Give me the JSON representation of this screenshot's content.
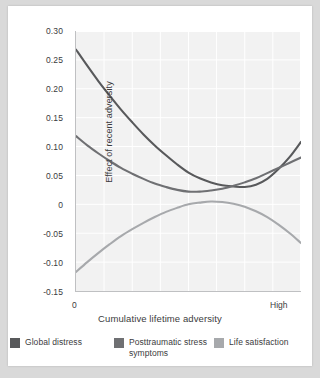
{
  "chart_data": {
    "type": "line",
    "title": "",
    "subtitle": "",
    "xlabel": "Cumulative lifetime adversity",
    "ylabel": "Effect of recent adversity",
    "xlim": [
      0,
      1
    ],
    "ylim": [
      -0.15,
      0.3
    ],
    "xtick_labels": [
      "0",
      "High"
    ],
    "ytick_labels": [
      "0.30",
      "0.25",
      "0.20",
      "0.15",
      "0.10",
      "0.05",
      "0",
      "-0.05",
      "-0.10",
      "-0.15"
    ],
    "ytick_values": [
      0.3,
      0.25,
      0.2,
      0.15,
      0.1,
      0.05,
      0,
      -0.05,
      -0.1,
      -0.15
    ],
    "grid": true,
    "grid_columns": 8,
    "grid_rows": 9,
    "legend_position": "bottom",
    "x": [
      0.0,
      0.05,
      0.1,
      0.15,
      0.2,
      0.25,
      0.3,
      0.35,
      0.4,
      0.45,
      0.5,
      0.55,
      0.6,
      0.65,
      0.7,
      0.75,
      0.8,
      0.85,
      0.9,
      0.95,
      1.0
    ],
    "series": [
      {
        "name": "Global distress",
        "color": "#58595b",
        "values": [
          0.268,
          0.24,
          0.213,
          0.188,
          0.164,
          0.142,
          0.121,
          0.102,
          0.085,
          0.069,
          0.055,
          0.045,
          0.038,
          0.033,
          0.031,
          0.03,
          0.034,
          0.044,
          0.061,
          0.082,
          0.108
        ]
      },
      {
        "name": "Posttraumatic stress symptoms",
        "color": "#6f7073",
        "values": [
          0.118,
          0.102,
          0.088,
          0.075,
          0.063,
          0.053,
          0.044,
          0.036,
          0.03,
          0.025,
          0.022,
          0.022,
          0.024,
          0.027,
          0.032,
          0.038,
          0.045,
          0.054,
          0.063,
          0.072,
          0.081
        ]
      },
      {
        "name": "Life satisfaction",
        "color": "#a7a9ac",
        "values": [
          -0.117,
          -0.1,
          -0.084,
          -0.069,
          -0.055,
          -0.043,
          -0.032,
          -0.022,
          -0.013,
          -0.006,
          0.0,
          0.003,
          0.005,
          0.004,
          0.001,
          -0.004,
          -0.012,
          -0.022,
          -0.035,
          -0.05,
          -0.067
        ]
      }
    ]
  },
  "axes": {
    "y_label": "Effect of recent adversity",
    "x_label": "Cumulative lifetime adversity",
    "x_tick_low": "0",
    "x_tick_high": "High",
    "y_ticks": [
      "0.30",
      "0.25",
      "0.20",
      "0.15",
      "0.10",
      "0.05",
      "0",
      "-0.05",
      "-0.10",
      "-0.15"
    ]
  },
  "legend": {
    "items": [
      {
        "label": "Global distress",
        "color": "#58595b"
      },
      {
        "label": "Posttraumatic stress symptoms",
        "color": "#6f7073"
      },
      {
        "label": "Life satisfaction",
        "color": "#a7a9ac"
      }
    ]
  },
  "colors": {
    "page_background": "#d9d9d9",
    "figure_background": "#ffffff",
    "plot_background": "#f2f2f2",
    "grid_line": "#ffffff",
    "axis_line": "#bfc0c2",
    "text": "#3b3b3d"
  }
}
